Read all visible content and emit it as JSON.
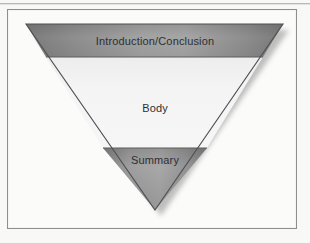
{
  "figure": {
    "shape": "inverted-triangle",
    "bands": [
      {
        "id": "introduction",
        "label": "Introduction/Conclusion",
        "fill": "#9a9a9a"
      },
      {
        "id": "body",
        "label": "Body",
        "fill": "#f1f1f1"
      },
      {
        "id": "summary",
        "label": "Summary",
        "fill": "#9d9d9d"
      }
    ],
    "colors": {
      "page_background": "#f8f8f6",
      "frame_border": "#8e8e90",
      "outline": "#4a4a4c",
      "band_edge_dark": "#7e7e7e",
      "band_center_light": "#a6a6a6",
      "body_light": "#f4f4f4",
      "shadow": "#b0b0b0",
      "text": "#2f2f33"
    },
    "geometry": {
      "top_left": [
        26,
        24
      ],
      "top_right": [
        283,
        24
      ],
      "apex": [
        155,
        210
      ],
      "band_divider_1_y": 57,
      "band_divider_2_y": 148
    }
  }
}
